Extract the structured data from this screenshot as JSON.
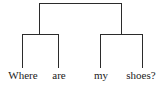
{
  "diagram": {
    "type": "constituency-tree",
    "line_color": "#2b2b2b",
    "text_color": "#222222",
    "leaves": [
      {
        "label": "Where"
      },
      {
        "label": "are"
      },
      {
        "label": "my"
      },
      {
        "label": "shoes?"
      }
    ],
    "structure": "[[Where are] [my shoes?]]"
  }
}
